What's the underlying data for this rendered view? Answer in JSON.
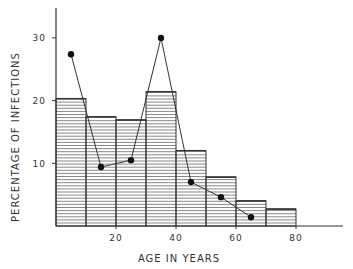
{
  "chart_data": {
    "type": "bar",
    "title": "",
    "xlabel": "AGE IN YEARS",
    "ylabel": "PERCENTAGE OF INFECTIONS",
    "xlim": [
      0,
      96
    ],
    "ylim": [
      0,
      35
    ],
    "x_ticks": [
      20,
      40,
      60,
      80
    ],
    "y_ticks": [
      10,
      20,
      30
    ],
    "grid": false,
    "legend": null,
    "histogram": {
      "name": "Age distribution (histogram)",
      "bin_edges": [
        0,
        10,
        20,
        30,
        40,
        50,
        60,
        70,
        80
      ],
      "categories": [
        "0-10",
        "10-20",
        "20-30",
        "30-40",
        "40-50",
        "50-60",
        "60-70",
        "70-80"
      ],
      "values": [
        20.3,
        17.4,
        16.9,
        21.4,
        12.0,
        7.8,
        4.0,
        2.7
      ],
      "fill": "horizontal-hatch"
    },
    "series": [
      {
        "name": "Percentage of infections (line)",
        "type": "line",
        "marker": "filled-circle",
        "x": [
          5,
          15,
          25,
          35,
          45,
          55,
          65
        ],
        "values": [
          27.4,
          9.4,
          10.5,
          30.0,
          7.0,
          4.6,
          1.4
        ]
      }
    ]
  },
  "ui": {
    "stroke_color": "#333333",
    "hatch_color": "#555555",
    "background": "#ffffff"
  }
}
